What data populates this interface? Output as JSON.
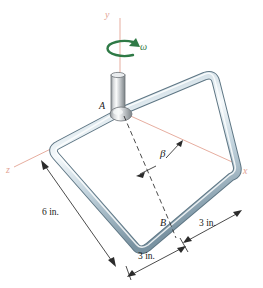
{
  "figure": {
    "colors": {
      "axis": "#e3a494",
      "rod_light": "#f2f6f8",
      "rod_mid": "#b9cbd6",
      "rod_dark": "#7d97a6",
      "shaft_light": "#f4f5f6",
      "shaft_mid": "#b9bdc0",
      "shaft_dark": "#7c8387",
      "omega": "#2f7a46",
      "dimension": "#2b2b2b",
      "dashed": "#2b2b2b"
    }
  },
  "axes": [
    {
      "id": "y-axis",
      "label": "y",
      "orientation": "vertical-up"
    },
    {
      "id": "x-axis",
      "label": "x",
      "orientation": "right-down"
    },
    {
      "id": "z-axis",
      "label": "z",
      "orientation": "left-down"
    }
  ],
  "annotations": {
    "omega": {
      "symbol": "ω",
      "name": "angular-velocity",
      "about_axis": "y"
    },
    "beta": {
      "symbol": "β",
      "name": "angle-beta",
      "between": [
        "diagonal-AB",
        "x-axis"
      ]
    }
  },
  "points": [
    {
      "id": "A",
      "label": "A",
      "description": "attachment of loop to shaft"
    },
    {
      "id": "B",
      "label": "B",
      "description": "opposite corner region of loop diagonal"
    }
  ],
  "dimensions": [
    {
      "id": "dim-6in-left",
      "label": "6 in.",
      "value": 6,
      "unit": "in.",
      "edge": "left side of square loop"
    },
    {
      "id": "dim-3in-right",
      "label": "3 in.",
      "value": 3,
      "unit": "in.",
      "edge": "right portion of bottom edge"
    },
    {
      "id": "dim-3in-bottom",
      "label": "3 in.",
      "value": 3,
      "unit": "in.",
      "edge": "left portion of bottom edge"
    }
  ]
}
